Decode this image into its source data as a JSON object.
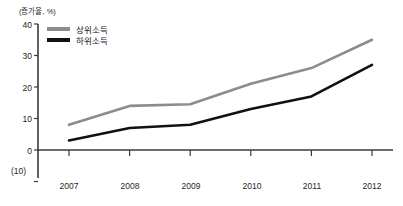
{
  "chart_data": {
    "type": "line",
    "title": "",
    "unit_label": "(증가율, %)",
    "xlabel": "",
    "ylabel": "",
    "categories": [
      "2007",
      "2008",
      "2009",
      "2010",
      "2011",
      "2012"
    ],
    "ylim": [
      -10,
      40
    ],
    "yticks": [
      "40",
      "30",
      "20",
      "10",
      "0",
      "(10)"
    ],
    "ytick_values": [
      40,
      30,
      20,
      10,
      0,
      -10
    ],
    "grid": false,
    "legend_position": "top-left",
    "series": [
      {
        "name": "상위소득",
        "color": "#8c8c8c",
        "values": [
          8,
          14,
          14.5,
          21,
          26,
          35
        ]
      },
      {
        "name": "하위소득",
        "color": "#111111",
        "values": [
          3,
          7,
          8,
          13,
          17,
          27
        ]
      }
    ]
  },
  "axis": {
    "line_color": "#3a3a3a"
  }
}
